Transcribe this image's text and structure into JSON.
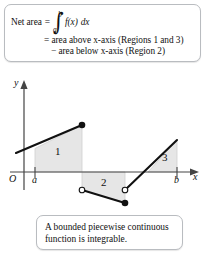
{
  "figure": {
    "kind": "piecewise-continuous-function-net-area-diagram",
    "top_callout": {
      "lead": "Net area",
      "equals": "=",
      "integral": {
        "sign": "∫",
        "upper_limit": "b",
        "lower_limit": "a",
        "integrand": "f(x)",
        "differential": "dx"
      },
      "line2": "= area above x-axis (Regions 1 and 3)",
      "line3": "− area below x-axis (Region 2)"
    },
    "bottom_callout": {
      "line1": "A bounded piecewise continuous",
      "line2": "function is integrable."
    },
    "axes": {
      "y_label": "y",
      "x_label": "x",
      "origin_label": "O",
      "tick_labels": [
        "a",
        "b"
      ]
    },
    "regions": [
      {
        "label": "1",
        "position": "above x-axis",
        "sign": "positive"
      },
      {
        "label": "2",
        "position": "below x-axis",
        "sign": "negative"
      },
      {
        "label": "3",
        "position": "above x-axis",
        "sign": "positive"
      }
    ],
    "endpoints": {
      "closed_dots": 2,
      "open_dots": 2
    },
    "colors": {
      "region_fill": "#e6e6e6",
      "region_stroke": "#c9c9c9",
      "curve": "#111111",
      "axis": "#444444",
      "callout_border": "#b9bcc0",
      "background": "#ffffff"
    }
  }
}
